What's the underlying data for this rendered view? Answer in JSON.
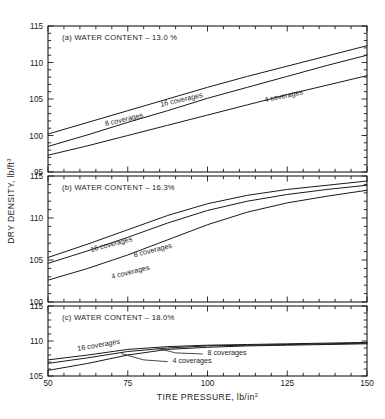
{
  "figure": {
    "axis_titles": {
      "x": "TIRE PRESSURE, lb/in",
      "x_sup": "2",
      "y": "DRY DENSITY, lb/ft",
      "y_sup": "3"
    }
  },
  "chart_data": [
    {
      "type": "line",
      "panel": "a",
      "title": "(a)  WATER CONTENT – 13.0 %",
      "xlabel": "TIRE PRESSURE, lb/in2",
      "ylabel": "DRY DENSITY, lb/ft3",
      "xlim": [
        50,
        150
      ],
      "ylim": [
        95,
        115
      ],
      "xticks": [
        50,
        75,
        100,
        125,
        150
      ],
      "xticklabels": [
        "50",
        "75",
        "100",
        "125",
        "150"
      ],
      "yticks": [
        95,
        100,
        105,
        110,
        115
      ],
      "yticklabels": [
        "95",
        "100",
        "105",
        "110",
        "115"
      ],
      "x_minor_step": 5,
      "y_minor_step": 1,
      "grid": false,
      "legend": "inline-labels",
      "x": [
        50,
        62.5,
        75,
        87.5,
        100,
        112.5,
        125,
        137.5,
        150
      ],
      "series": [
        {
          "name": "16 coverages",
          "label": "16 coverages",
          "values": [
            100.2,
            101.8,
            103.4,
            105.0,
            106.6,
            108.1,
            109.5,
            110.9,
            112.3
          ]
        },
        {
          "name": "8 coverages",
          "label": "8 coverages",
          "values": [
            98.5,
            100.1,
            101.8,
            103.4,
            105.1,
            106.6,
            108.1,
            109.6,
            111.0
          ]
        },
        {
          "name": "4 coverages",
          "label": "4 coverages",
          "values": [
            97.3,
            98.6,
            100.0,
            101.4,
            102.8,
            104.2,
            105.6,
            106.9,
            108.2
          ]
        }
      ]
    },
    {
      "type": "line",
      "panel": "b",
      "title": "(b)  WATER CONTENT – 16.3%",
      "xlabel": "TIRE PRESSURE, lb/in2",
      "ylabel": "DRY DENSITY, lb/ft3",
      "xlim": [
        50,
        150
      ],
      "ylim": [
        100,
        115
      ],
      "xticks": [
        50,
        75,
        100,
        125,
        150
      ],
      "xticklabels": [
        "50",
        "75",
        "100",
        "125",
        "150"
      ],
      "yticks": [
        100,
        105,
        110,
        115
      ],
      "yticklabels": [
        "100",
        "105",
        "110",
        "115"
      ],
      "x_minor_step": 5,
      "y_minor_step": 1,
      "grid": false,
      "legend": "inline-labels",
      "x": [
        50,
        62.5,
        75,
        87.5,
        100,
        112.5,
        125,
        137.5,
        150
      ],
      "series": [
        {
          "name": "16 coverages",
          "label": "16 coverages",
          "values": [
            105.3,
            106.9,
            108.6,
            110.3,
            111.7,
            112.7,
            113.4,
            113.9,
            114.4
          ]
        },
        {
          "name": "8 coverages",
          "label": "8 coverages",
          "values": [
            104.6,
            106.1,
            107.7,
            109.4,
            110.9,
            112.0,
            112.8,
            113.4,
            113.9
          ]
        },
        {
          "name": "4 coverages",
          "label": "4 coverages",
          "values": [
            102.6,
            104.0,
            105.6,
            107.4,
            109.2,
            110.7,
            111.8,
            112.6,
            113.3
          ]
        }
      ]
    },
    {
      "type": "line",
      "panel": "c",
      "title": "(c)  WATER CONTENT – 18.0%",
      "xlabel": "TIRE PRESSURE, lb/in2",
      "ylabel": "DRY DENSITY, lb/ft3",
      "xlim": [
        50,
        150
      ],
      "ylim": [
        105,
        115
      ],
      "xticks": [
        50,
        75,
        100,
        125,
        150
      ],
      "xticklabels": [
        "50",
        "75",
        "100",
        "125",
        "150"
      ],
      "yticks": [
        105,
        110,
        115
      ],
      "yticklabels": [
        "105",
        "110",
        "115"
      ],
      "x_minor_step": 5,
      "y_minor_step": 1,
      "grid": false,
      "legend": "inline-labels-with-leaders",
      "x": [
        50,
        62.5,
        75,
        87.5,
        100,
        112.5,
        125,
        137.5,
        150
      ],
      "series": [
        {
          "name": "16 coverages",
          "label": "16 coverages",
          "values": [
            107.3,
            108.0,
            108.8,
            109.2,
            109.4,
            109.5,
            109.6,
            109.7,
            109.8
          ]
        },
        {
          "name": "8 coverages",
          "label": "8 coverages",
          "values": [
            106.8,
            107.6,
            108.5,
            109.0,
            109.3,
            109.4,
            109.5,
            109.6,
            109.7
          ]
        },
        {
          "name": "4 coverages",
          "label": "4 coverages",
          "values": [
            105.8,
            106.8,
            108.0,
            108.8,
            109.1,
            109.3,
            109.4,
            109.5,
            109.6
          ]
        }
      ]
    }
  ]
}
